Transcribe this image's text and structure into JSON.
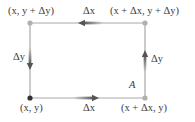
{
  "diagram": {
    "corners": {
      "bottom_left": "(x, y)",
      "top_left": "(x, y + Δy)",
      "top_right": "(x + Δx, y + Δy)",
      "bottom_right": "(x + Δx, y)"
    },
    "edges": {
      "bottom": "Δx",
      "top": "Δx",
      "left": "Δy",
      "right": "Δy"
    },
    "region_label": "A",
    "colors": {
      "line": "#a8a8a8",
      "arrow": "#555555",
      "dot_corner": "#b0b0b0",
      "dot_origin": "#333333",
      "text": "#3a3a3a"
    }
  }
}
